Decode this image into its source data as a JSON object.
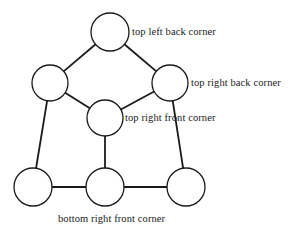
{
  "diagram": {
    "background_color": "#ffffff",
    "stroke_color": "#1a1a1a",
    "node_fill_color": "#ffffff",
    "nodes": [
      {
        "id": "top-left-back",
        "cx": 110,
        "cy": 32,
        "r": 19
      },
      {
        "id": "left-middle",
        "cx": 50,
        "cy": 83,
        "r": 18
      },
      {
        "id": "top-right-back",
        "cx": 170,
        "cy": 83,
        "r": 18
      },
      {
        "id": "top-right-front",
        "cx": 105,
        "cy": 118,
        "r": 18
      },
      {
        "id": "bottom-left-front",
        "cx": 33,
        "cy": 187,
        "r": 19
      },
      {
        "id": "bottom-middle",
        "cx": 105,
        "cy": 187,
        "r": 19
      },
      {
        "id": "bottom-right",
        "cx": 186,
        "cy": 187,
        "r": 19
      }
    ],
    "edges": [
      {
        "from": "top-left-back",
        "to": "left-middle"
      },
      {
        "from": "top-left-back",
        "to": "top-right-back"
      },
      {
        "from": "left-middle",
        "to": "top-right-front"
      },
      {
        "from": "top-right-back",
        "to": "top-right-front"
      },
      {
        "from": "left-middle",
        "to": "bottom-left-front"
      },
      {
        "from": "top-right-front",
        "to": "bottom-middle"
      },
      {
        "from": "top-right-back",
        "to": "bottom-right"
      },
      {
        "from": "bottom-left-front",
        "to": "bottom-middle"
      },
      {
        "from": "bottom-middle",
        "to": "bottom-right"
      }
    ],
    "labels": {
      "top_left_back": "top left back corner",
      "top_right_back": "top right back corner",
      "top_right_front": "top right front corner",
      "bottom_right_front": "bottom right front corner"
    }
  }
}
